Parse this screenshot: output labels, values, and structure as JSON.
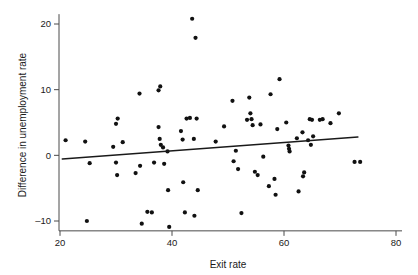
{
  "chart_data": {
    "type": "scatter",
    "title": "",
    "xlabel": "Exit rate",
    "ylabel": "Difference in unemployment rate",
    "xlim": [
      20,
      80
    ],
    "ylim": [
      -11.5,
      21.5
    ],
    "xticks": [
      20,
      40,
      60,
      80
    ],
    "yticks": [
      20,
      10,
      0,
      -10
    ],
    "xtick_labels": [
      "20",
      "40",
      "60",
      "80"
    ],
    "ytick_labels": [
      "20",
      "10",
      "0",
      "–10"
    ],
    "grid": false,
    "legend": null,
    "series": [
      {
        "name": "observations",
        "marker": "filled-circle",
        "color": "#111111",
        "points": [
          [
            21.0,
            2.3
          ],
          [
            24.5,
            2.1
          ],
          [
            25.3,
            -1.2
          ],
          [
            24.8,
            -10.0
          ],
          [
            29.5,
            1.3
          ],
          [
            30.0,
            4.8
          ],
          [
            30.3,
            5.6
          ],
          [
            31.2,
            2.0
          ],
          [
            30.0,
            -1.1
          ],
          [
            30.2,
            -3.0
          ],
          [
            33.5,
            -2.7
          ],
          [
            34.2,
            9.4
          ],
          [
            34.3,
            -1.6
          ],
          [
            34.6,
            -10.4
          ],
          [
            35.6,
            -8.6
          ],
          [
            36.4,
            -8.7
          ],
          [
            36.8,
            -1.1
          ],
          [
            37.6,
            9.9
          ],
          [
            37.9,
            10.5
          ],
          [
            37.6,
            4.3
          ],
          [
            37.8,
            2.5
          ],
          [
            38.0,
            1.6
          ],
          [
            38.4,
            1.2
          ],
          [
            38.6,
            -1.3
          ],
          [
            39.2,
            0.6
          ],
          [
            39.3,
            -5.3
          ],
          [
            39.5,
            -10.9
          ],
          [
            41.6,
            3.7
          ],
          [
            41.9,
            2.4
          ],
          [
            42.0,
            -4.1
          ],
          [
            42.3,
            -8.7
          ],
          [
            42.6,
            5.6
          ],
          [
            43.2,
            5.7
          ],
          [
            43.6,
            20.8
          ],
          [
            43.9,
            2.5
          ],
          [
            44.2,
            17.9
          ],
          [
            44.4,
            5.6
          ],
          [
            44.6,
            -5.3
          ],
          [
            44.0,
            -9.2
          ],
          [
            47.8,
            2.1
          ],
          [
            49.3,
            4.4
          ],
          [
            50.8,
            8.3
          ],
          [
            51.4,
            0.7
          ],
          [
            51.0,
            -0.9
          ],
          [
            51.8,
            -2.1
          ],
          [
            52.4,
            -8.8
          ],
          [
            53.4,
            5.4
          ],
          [
            53.8,
            8.8
          ],
          [
            54.0,
            6.4
          ],
          [
            54.2,
            5.5
          ],
          [
            54.4,
            4.6
          ],
          [
            54.8,
            -2.5
          ],
          [
            55.3,
            -3.0
          ],
          [
            55.8,
            4.7
          ],
          [
            56.3,
            -0.2
          ],
          [
            57.3,
            -4.7
          ],
          [
            57.6,
            9.3
          ],
          [
            58.3,
            -3.6
          ],
          [
            58.8,
            4.0
          ],
          [
            58.5,
            -6.0
          ],
          [
            59.2,
            11.6
          ],
          [
            60.4,
            5.0
          ],
          [
            60.8,
            1.5
          ],
          [
            60.9,
            1.0
          ],
          [
            61.0,
            0.6
          ],
          [
            62.3,
            2.6
          ],
          [
            62.6,
            -5.5
          ],
          [
            63.3,
            3.5
          ],
          [
            63.6,
            -2.6
          ],
          [
            63.4,
            -3.2
          ],
          [
            64.3,
            2.3
          ],
          [
            64.6,
            5.5
          ],
          [
            65.0,
            5.4
          ],
          [
            64.8,
            1.6
          ],
          [
            65.2,
            2.9
          ],
          [
            66.4,
            5.4
          ],
          [
            66.9,
            5.5
          ],
          [
            68.3,
            4.9
          ],
          [
            69.8,
            6.4
          ],
          [
            72.6,
            -1.0
          ],
          [
            73.6,
            -1.0
          ]
        ]
      }
    ],
    "fit_line": {
      "name": "linear fit",
      "x0": 20.4,
      "y0": -0.55,
      "x1": 73.2,
      "y1": 2.8,
      "color": "#1a1a1a"
    }
  },
  "axes": {
    "x_axis_name": "x-axis",
    "y_axis_name": "y-axis"
  }
}
